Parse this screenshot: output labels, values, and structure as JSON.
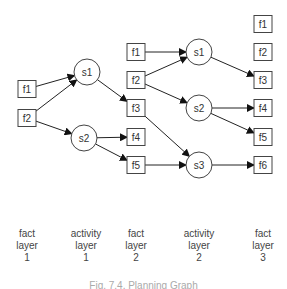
{
  "diagram": {
    "type": "planning-graph",
    "nodes": {
      "L1_f1": {
        "label": "f1",
        "shape": "box",
        "x": 27,
        "y": 89
      },
      "L1_f2": {
        "label": "f2",
        "shape": "box",
        "x": 27,
        "y": 118
      },
      "A1_s1": {
        "label": "s1",
        "shape": "circle",
        "x": 87,
        "y": 72
      },
      "A1_s2": {
        "label": "s2",
        "shape": "circle",
        "x": 84,
        "y": 138
      },
      "L2_f1": {
        "label": "f1",
        "shape": "box",
        "x": 136,
        "y": 52
      },
      "L2_f2": {
        "label": "f2",
        "shape": "box",
        "x": 136,
        "y": 80
      },
      "L2_f3": {
        "label": "f3",
        "shape": "box",
        "x": 136,
        "y": 108
      },
      "L2_f4": {
        "label": "f4",
        "shape": "box",
        "x": 136,
        "y": 137
      },
      "L2_f5": {
        "label": "f5",
        "shape": "box",
        "x": 136,
        "y": 165
      },
      "A2_s1": {
        "label": "s1",
        "shape": "circle",
        "x": 199,
        "y": 52
      },
      "A2_s2": {
        "label": "s2",
        "shape": "circle",
        "x": 199,
        "y": 108
      },
      "A2_s3": {
        "label": "s3",
        "shape": "circle",
        "x": 199,
        "y": 165
      },
      "L3_f1": {
        "label": "f1",
        "shape": "box",
        "x": 263,
        "y": 24
      },
      "L3_f2": {
        "label": "f2",
        "shape": "box",
        "x": 263,
        "y": 52
      },
      "L3_f3": {
        "label": "f3",
        "shape": "box",
        "x": 263,
        "y": 80
      },
      "L3_f4": {
        "label": "f4",
        "shape": "box",
        "x": 263,
        "y": 108
      },
      "L3_f5": {
        "label": "f5",
        "shape": "box",
        "x": 263,
        "y": 137
      },
      "L3_f6": {
        "label": "f6",
        "shape": "box",
        "x": 263,
        "y": 165
      }
    },
    "edges": [
      [
        "L1_f1",
        "A1_s1"
      ],
      [
        "L1_f2",
        "A1_s1"
      ],
      [
        "L1_f2",
        "A1_s2"
      ],
      [
        "A1_s1",
        "L2_f3"
      ],
      [
        "A1_s2",
        "L2_f4"
      ],
      [
        "A1_s2",
        "L2_f5"
      ],
      [
        "L2_f1",
        "A2_s1"
      ],
      [
        "L2_f2",
        "A2_s1"
      ],
      [
        "L2_f2",
        "A2_s2"
      ],
      [
        "L2_f3",
        "A2_s3"
      ],
      [
        "L2_f5",
        "A2_s3"
      ],
      [
        "A2_s1",
        "L3_f3"
      ],
      [
        "A2_s2",
        "L3_f4"
      ],
      [
        "A2_s2",
        "L3_f5"
      ],
      [
        "A2_s3",
        "L3_f6"
      ]
    ]
  },
  "layers": [
    {
      "line1": "fact",
      "line2": "layer",
      "line3": "1",
      "x": 27
    },
    {
      "line1": "activity",
      "line2": "layer",
      "line3": "1",
      "x": 86
    },
    {
      "line1": "fact",
      "line2": "layer",
      "line3": "2",
      "x": 136
    },
    {
      "line1": "activity",
      "line2": "layer",
      "line3": "2",
      "x": 199
    },
    {
      "line1": "fact",
      "line2": "layer",
      "line3": "3",
      "x": 263
    }
  ],
  "caption": "Fig. 7.4. Planning Graph"
}
